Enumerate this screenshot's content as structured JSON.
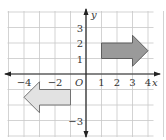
{
  "figure": {
    "type": "coordinate-plane-translation",
    "grid": {
      "x_min": -5,
      "x_max": 5,
      "y_min": -4,
      "y_max": 4
    },
    "axes": {
      "x_label": "x",
      "y_label": "y",
      "origin_label": "O",
      "x_ticks": [
        {
          "value": -4,
          "label": "−4"
        },
        {
          "value": -2,
          "label": "−2"
        },
        {
          "value": 1,
          "label": "1"
        },
        {
          "value": 2,
          "label": "2"
        },
        {
          "value": 3,
          "label": "3"
        },
        {
          "value": 4,
          "label": "4"
        }
      ],
      "y_ticks": [
        {
          "value": 3,
          "label": "3"
        },
        {
          "value": 2,
          "label": "2"
        },
        {
          "value": 1,
          "label": "1"
        },
        {
          "value": -3,
          "label": "−3"
        }
      ]
    },
    "shapes": [
      {
        "name": "dark-arrow-right",
        "direction": "right",
        "fill": "#9a9a9a",
        "stroke": "#555555",
        "vertices": [
          [
            1,
            1
          ],
          [
            3,
            1
          ],
          [
            3,
            0.5
          ],
          [
            4,
            1.5
          ],
          [
            3,
            2.5
          ],
          [
            3,
            2
          ],
          [
            1,
            2
          ]
        ]
      },
      {
        "name": "light-arrow-left",
        "direction": "left",
        "fill": "#e2e2e2",
        "stroke": "#666666",
        "vertices": [
          [
            -1,
            -1
          ],
          [
            -3,
            -1
          ],
          [
            -3,
            -0.5
          ],
          [
            -4,
            -1.5
          ],
          [
            -3,
            -2.5
          ],
          [
            -3,
            -2
          ],
          [
            -1,
            -2
          ]
        ]
      }
    ],
    "colors": {
      "grid": "#c8c8c8",
      "axis": "#222222"
    }
  }
}
